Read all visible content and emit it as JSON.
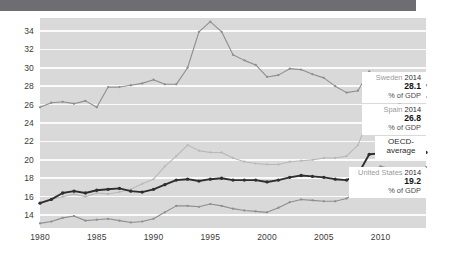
{
  "chart_data": {
    "type": "line",
    "title": "",
    "subtitle": "",
    "xlabel": "",
    "ylabel": "",
    "unit": "% of GDP",
    "grid": true,
    "legend_position": "inline-callouts",
    "xlim": [
      1980,
      2014
    ],
    "ylim": [
      12.6,
      35.4
    ],
    "yticks": [
      14,
      16,
      18,
      20,
      22,
      24,
      26,
      28,
      30,
      32,
      34
    ],
    "xticks": [
      1980,
      1985,
      1990,
      1995,
      2000,
      2005,
      2010
    ],
    "x": [
      1980,
      1981,
      1982,
      1983,
      1984,
      1985,
      1986,
      1987,
      1988,
      1989,
      1990,
      1991,
      1992,
      1993,
      1994,
      1995,
      1996,
      1997,
      1998,
      1999,
      2000,
      2001,
      2002,
      2003,
      2004,
      2005,
      2006,
      2007,
      2008,
      2009,
      2010,
      2011,
      2012,
      2013,
      2014
    ],
    "series": [
      {
        "name": "Sweden",
        "color": "#8e8e8e",
        "end_year": 2014,
        "end_value": 28.1,
        "values": [
          25.7,
          26.2,
          26.3,
          26.1,
          26.4,
          25.7,
          27.9,
          27.9,
          28.1,
          28.3,
          28.7,
          28.2,
          28.2,
          30.0,
          33.9,
          35.0,
          33.9,
          31.4,
          30.8,
          30.3,
          29.0,
          29.2,
          29.9,
          29.8,
          29.3,
          28.9,
          28.0,
          27.3,
          27.5,
          29.6,
          28.0,
          27.6,
          27.9,
          28.4,
          28.1
        ]
      },
      {
        "name": "Spain",
        "color": "#b8b8b8",
        "end_year": 2014,
        "end_value": 26.8,
        "values": [
          15.3,
          15.7,
          16.0,
          16.3,
          16.0,
          16.4,
          16.3,
          16.5,
          16.8,
          17.4,
          17.9,
          19.3,
          20.4,
          21.6,
          21.0,
          20.8,
          20.8,
          20.2,
          19.8,
          19.6,
          19.5,
          19.5,
          19.8,
          19.9,
          20.0,
          20.2,
          20.2,
          20.4,
          21.6,
          24.6,
          25.2,
          25.7,
          26.3,
          26.9,
          26.8
        ]
      },
      {
        "name": "OECD-average",
        "color": "#2e2e2e",
        "end_year": 2014,
        "end_value": null,
        "values": [
          15.3,
          15.7,
          16.4,
          16.6,
          16.4,
          16.7,
          16.8,
          16.9,
          16.6,
          16.5,
          16.8,
          17.3,
          17.8,
          17.9,
          17.7,
          17.9,
          18.0,
          17.8,
          17.8,
          17.8,
          17.6,
          17.8,
          18.1,
          18.3,
          18.2,
          18.1,
          17.9,
          17.8,
          18.4,
          20.6,
          20.7,
          20.5,
          20.8,
          20.9,
          20.8
        ]
      },
      {
        "name": "United States",
        "color": "#8e8e8e",
        "end_year": 2014,
        "end_value": 19.2,
        "values": [
          13.1,
          13.3,
          13.7,
          13.9,
          13.4,
          13.5,
          13.6,
          13.4,
          13.2,
          13.3,
          13.6,
          14.3,
          15.0,
          15.0,
          14.9,
          15.2,
          15.0,
          14.7,
          14.5,
          14.4,
          14.3,
          14.8,
          15.4,
          15.7,
          15.6,
          15.5,
          15.5,
          15.8,
          16.6,
          18.5,
          19.3,
          19.0,
          18.8,
          18.9,
          19.2
        ]
      }
    ]
  },
  "callouts": [
    {
      "id": "sweden",
      "country": "Sweden",
      "year": "2014",
      "value": "28.1",
      "unit": "% of GDP"
    },
    {
      "id": "spain",
      "country": "Spain",
      "year": "2014",
      "value": "26.8",
      "unit": "% of GDP"
    },
    {
      "id": "oecd",
      "line1": "OECD-",
      "line2": "average"
    },
    {
      "id": "united-states",
      "country": "United States",
      "year": "2014",
      "value": "19.2",
      "unit": "% of GDP"
    }
  ]
}
